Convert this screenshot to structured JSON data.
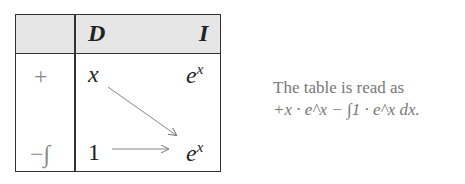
{
  "table": {
    "header": {
      "derivative_label": "D",
      "integral_label": "I"
    },
    "rows": [
      {
        "sign": "+",
        "d": "x",
        "i_base": "e",
        "i_exp": "x"
      },
      {
        "sign": "−∫",
        "d": "1",
        "i_base": "e",
        "i_exp": "x"
      }
    ],
    "arrows": [
      "diagonal",
      "horizontal"
    ]
  },
  "caption": {
    "line1": "The table is read as",
    "line2": "+x · e^x − ∫1 · e^x dx."
  }
}
